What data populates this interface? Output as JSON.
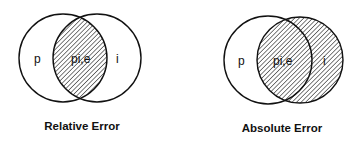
{
  "diagrams": [
    {
      "caption": "Relative Error",
      "left_label": "p",
      "center_label": "pi,e",
      "right_label": "i",
      "shaded": "intersection"
    },
    {
      "caption": "Absolute Error",
      "left_label": "p",
      "center_label": "pi,e",
      "right_label": "i",
      "shaded": "right-circle"
    }
  ]
}
